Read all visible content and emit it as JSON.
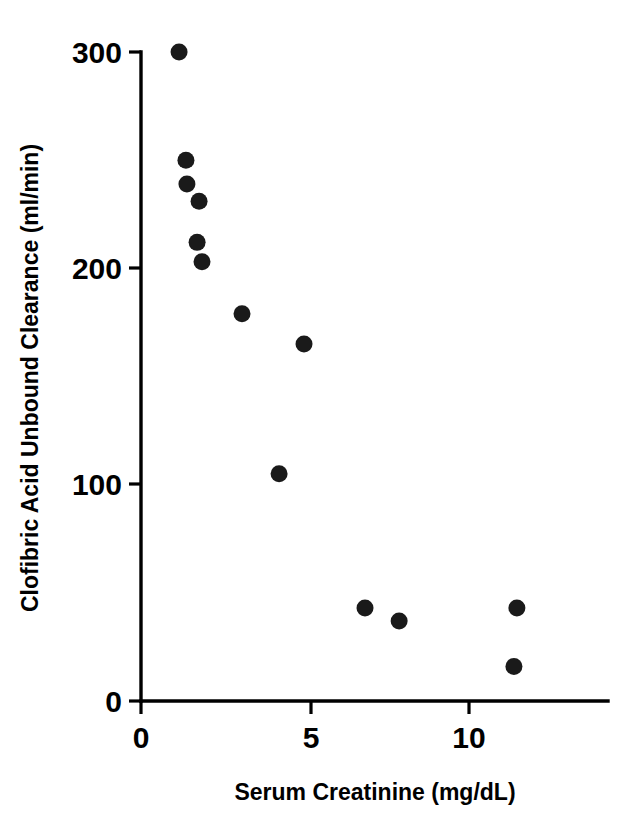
{
  "chart_data": {
    "type": "scatter",
    "title": "",
    "xlabel": "Serum Creatinine (mg/dL)",
    "ylabel": "Clofibric Acid Unbound Clearance (ml/min)",
    "xlim": [
      0,
      14.3
    ],
    "ylim": [
      0,
      300
    ],
    "xticks": [
      0,
      5,
      10
    ],
    "xtick_labels": [
      "0",
      "5",
      "10"
    ],
    "yticks": [
      0,
      100,
      200,
      300
    ],
    "ytick_labels": [
      "0",
      "100",
      "200",
      "300"
    ],
    "grid": false,
    "legend": null,
    "marker": {
      "shape": "circle",
      "color": "#1a1a1a",
      "size_px": 17
    },
    "series": [
      {
        "name": "patients",
        "points": [
          {
            "x": 1.16,
            "y": 300
          },
          {
            "x": 1.37,
            "y": 250
          },
          {
            "x": 1.4,
            "y": 239
          },
          {
            "x": 1.77,
            "y": 231
          },
          {
            "x": 1.71,
            "y": 212
          },
          {
            "x": 1.86,
            "y": 203
          },
          {
            "x": 3.08,
            "y": 179
          },
          {
            "x": 4.97,
            "y": 165
          },
          {
            "x": 4.21,
            "y": 105
          },
          {
            "x": 6.83,
            "y": 43
          },
          {
            "x": 7.87,
            "y": 37
          },
          {
            "x": 11.46,
            "y": 43
          },
          {
            "x": 11.37,
            "y": 16
          }
        ]
      }
    ]
  },
  "figure": {
    "background_color": "#ffffff",
    "axis_color": "#000000"
  }
}
